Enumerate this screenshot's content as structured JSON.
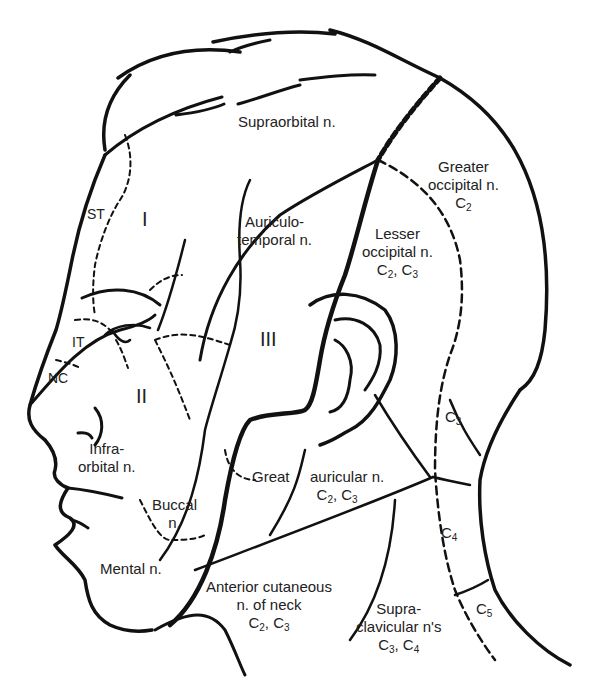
{
  "diagram": {
    "labels": {
      "supraorbital": "Supraorbital n.",
      "greater_occipital_1": "Greater",
      "greater_occipital_2": "occipital n.",
      "greater_occipital_c": "C",
      "greater_occipital_sub": "2",
      "auriculotemporal_1": "Auriculo-",
      "auriculotemporal_2": "temporal n.",
      "lesser_occipital_1": "Lesser",
      "lesser_occipital_2": "occipital n.",
      "st": "ST",
      "it": "IT",
      "nc": "NC",
      "roman_1": "I",
      "roman_2": "II",
      "roman_3": "III",
      "infraorbital_1": "Infra-",
      "infraorbital_2": "orbital n.",
      "buccal_1": "Buccal",
      "buccal_2": "n.",
      "mental": "Mental n.",
      "great_auricular_1": "Great",
      "great_auricular_2": "auricular n.",
      "anterior_cutaneous_1": "Anterior cutaneous",
      "anterior_cutaneous_2": "n. of neck",
      "supraclavicular_1": "Supra-",
      "supraclavicular_2": "clavicular n's",
      "c3": "C",
      "c4": "C",
      "c5": "C",
      "sub_2": "2",
      "sub_3": "3",
      "sub_4": "4",
      "sub_5": "5",
      "comma": ", C"
    }
  }
}
